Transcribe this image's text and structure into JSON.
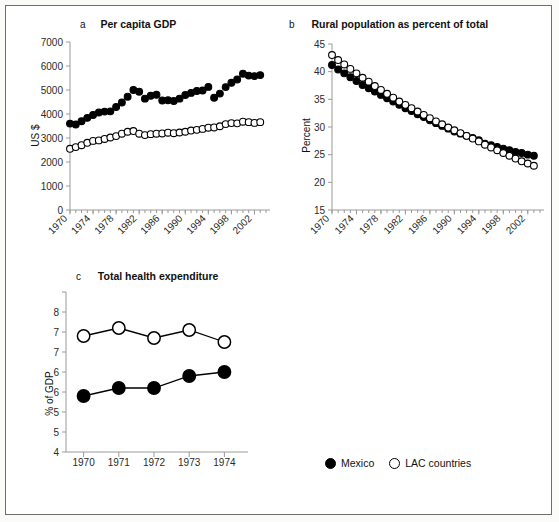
{
  "figure": {
    "background": "#ffffff",
    "border_color": "#6f6f6f"
  },
  "legend": {
    "mexico_label": "Mexico",
    "lac_label": "LAC countries",
    "mexico_marker": "filled-circle-icon",
    "lac_marker": "open-circle-icon"
  },
  "panels": {
    "a": {
      "letter": "a",
      "title": "Per capita GDP",
      "ylabel": "US $"
    },
    "b": {
      "letter": "b",
      "title": "Rural population as percent of total",
      "ylabel": "Percent"
    },
    "c": {
      "letter": "c",
      "title": "Total health expenditure",
      "ylabel": "% of GDP"
    }
  },
  "chart_data": [
    {
      "panel": "a",
      "type": "line",
      "title": "Per capita GDP",
      "panel_letter": "a",
      "xlabel": "",
      "ylabel": "US $",
      "ylim": [
        0,
        7000
      ],
      "yticks": [
        0,
        1000,
        2000,
        3000,
        4000,
        5000,
        6000,
        7000
      ],
      "ytick_labels": [
        "0",
        "1000",
        "2000",
        "3000",
        "4000",
        "5000",
        "6000",
        "7000"
      ],
      "xlim": [
        1970,
        2004
      ],
      "xticks_major": [
        1970,
        1974,
        1978,
        1982,
        1986,
        1990,
        1994,
        1998,
        2002
      ],
      "xtick_labels": [
        "1970",
        "1974",
        "1978",
        "1982",
        "1986",
        "1990",
        "1994",
        "1998",
        "2002"
      ],
      "xticks_minor_every": 1,
      "grid": false,
      "legend_position": "figure-bottom",
      "x": [
        1970,
        1971,
        1972,
        1973,
        1974,
        1975,
        1976,
        1977,
        1978,
        1979,
        1980,
        1981,
        1982,
        1983,
        1984,
        1985,
        1986,
        1987,
        1988,
        1989,
        1990,
        1991,
        1992,
        1993,
        1994,
        1995,
        1996,
        1997,
        1998,
        1999,
        2000,
        2001,
        2002,
        2003
      ],
      "series": [
        {
          "name": "Mexico",
          "marker": "filled-circle",
          "values": [
            3600,
            3560,
            3700,
            3840,
            3960,
            4060,
            4100,
            4110,
            4290,
            4480,
            4720,
            5000,
            4930,
            4640,
            4760,
            4800,
            4560,
            4570,
            4540,
            4640,
            4790,
            4880,
            4960,
            4980,
            5130,
            4680,
            4850,
            5120,
            5300,
            5440,
            5680,
            5600,
            5580,
            5620
          ]
        },
        {
          "name": "LAC countries",
          "marker": "open-circle",
          "values": [
            2550,
            2620,
            2700,
            2800,
            2880,
            2900,
            2960,
            3020,
            3080,
            3180,
            3260,
            3290,
            3180,
            3120,
            3160,
            3180,
            3190,
            3220,
            3200,
            3230,
            3260,
            3310,
            3340,
            3380,
            3430,
            3440,
            3490,
            3580,
            3620,
            3610,
            3680,
            3660,
            3630,
            3660
          ]
        }
      ]
    },
    {
      "panel": "b",
      "type": "line",
      "title": "Rural population as percent of total",
      "panel_letter": "b",
      "xlabel": "",
      "ylabel": "Percent",
      "ylim": [
        15,
        45
      ],
      "yticks": [
        15,
        20,
        25,
        30,
        35,
        40,
        45
      ],
      "ytick_labels": [
        "15",
        "20",
        "25",
        "30",
        "35",
        "40",
        "45"
      ],
      "xlim": [
        1970,
        2004
      ],
      "xticks_major": [
        1970,
        1974,
        1978,
        1982,
        1986,
        1990,
        1994,
        1998,
        2002
      ],
      "xtick_labels": [
        "1970",
        "1974",
        "1978",
        "1982",
        "1986",
        "1990",
        "1994",
        "1998",
        "2002"
      ],
      "xticks_minor_every": 1,
      "grid": false,
      "legend_position": "figure-bottom",
      "x": [
        1970,
        1971,
        1972,
        1973,
        1974,
        1975,
        1976,
        1977,
        1978,
        1979,
        1980,
        1981,
        1982,
        1983,
        1984,
        1985,
        1986,
        1987,
        1988,
        1989,
        1990,
        1991,
        1992,
        1993,
        1994,
        1995,
        1996,
        1997,
        1998,
        1999,
        2000,
        2001,
        2002,
        2003
      ],
      "series": [
        {
          "name": "Mexico",
          "marker": "filled-circle",
          "values": [
            41.2,
            40.4,
            39.7,
            39.0,
            38.3,
            37.6,
            37.0,
            36.4,
            35.8,
            35.2,
            34.6,
            34.0,
            33.4,
            32.9,
            32.3,
            31.8,
            31.2,
            30.7,
            30.2,
            29.7,
            29.2,
            28.8,
            28.4,
            28.0,
            27.6,
            27.0,
            26.7,
            26.4,
            26.1,
            25.8,
            25.5,
            25.3,
            25.0,
            24.8
          ]
        },
        {
          "name": "LAC countries",
          "marker": "open-circle",
          "values": [
            43.0,
            42.1,
            41.3,
            40.5,
            39.7,
            38.9,
            38.2,
            37.4,
            36.7,
            36.0,
            35.3,
            34.6,
            34.0,
            33.4,
            32.8,
            32.2,
            31.6,
            31.0,
            30.5,
            29.9,
            29.4,
            28.9,
            28.4,
            27.9,
            27.4,
            26.8,
            26.3,
            25.8,
            25.3,
            24.8,
            24.3,
            23.8,
            23.4,
            23.0
          ]
        }
      ]
    },
    {
      "panel": "c",
      "type": "line",
      "title": "Total health expenditure",
      "panel_letter": "c",
      "xlabel": "",
      "ylabel": "% of GDP",
      "ylim": [
        4,
        8
      ],
      "yticks": [
        4,
        4.5,
        5,
        5.5,
        6,
        6.5,
        7,
        7.5,
        8
      ],
      "ytick_labels": [
        "4",
        "5",
        "5",
        "6",
        "6",
        "7",
        "7",
        "8"
      ],
      "ytick_labels_shown": [
        "8",
        "7",
        "7",
        "6",
        "6",
        "5",
        "5",
        "4"
      ],
      "xlim": [
        1969.5,
        1974.5
      ],
      "xticks_major": [
        1970,
        1971,
        1972,
        1973,
        1974
      ],
      "xtick_labels": [
        "1970",
        "1971",
        "1972",
        "1973",
        "1974"
      ],
      "grid": false,
      "legend_position": "figure-bottom",
      "x": [
        1970,
        1971,
        1972,
        1973,
        1974
      ],
      "series": [
        {
          "name": "Mexico",
          "marker": "filled-circle",
          "values": [
            5.4,
            5.6,
            5.6,
            5.9,
            6.0
          ]
        },
        {
          "name": "LAC countries",
          "marker": "open-circle",
          "values": [
            6.9,
            7.1,
            6.85,
            7.05,
            6.75
          ]
        }
      ]
    }
  ]
}
